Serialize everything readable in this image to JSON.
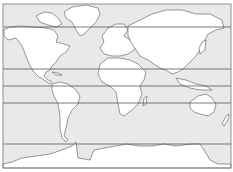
{
  "map": {
    "type": "blank world outline map",
    "projection": "cylindrical",
    "colors": {
      "ocean": "#e9e9e9",
      "land": "#ffffff",
      "outline": "#555555",
      "latitude_lines": "#444444"
    },
    "latitude_lines": [
      {
        "name": "arctic-circle",
        "y": 27
      },
      {
        "name": "tropic-of-cancer",
        "y": 69
      },
      {
        "name": "equator",
        "y": 86
      },
      {
        "name": "tropic-of-capricorn",
        "y": 103
      },
      {
        "name": "antarctic-circle",
        "y": 144
      }
    ],
    "landmasses": [
      "North America",
      "Greenland",
      "South America",
      "Europe",
      "Africa",
      "Asia",
      "Australia",
      "New Zealand",
      "Antarctica"
    ]
  }
}
